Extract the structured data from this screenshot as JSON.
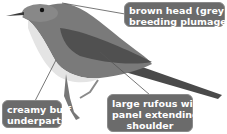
{
  "figure": {
    "colors": {
      "callout_bg": "#6b6b6b",
      "callout_text": "#ffffff",
      "leader_line": "#555555",
      "background": "#ffffff"
    },
    "callouts": [
      {
        "id": "head",
        "lines": [
          "brown head (grey in",
          "breeding plumage)"
        ]
      },
      {
        "id": "underparts",
        "lines": [
          "creamy buff",
          "underparts"
        ]
      },
      {
        "id": "wing",
        "lines": [
          "large rufous wing",
          "panel extending to",
          "shoulder"
        ]
      }
    ]
  }
}
